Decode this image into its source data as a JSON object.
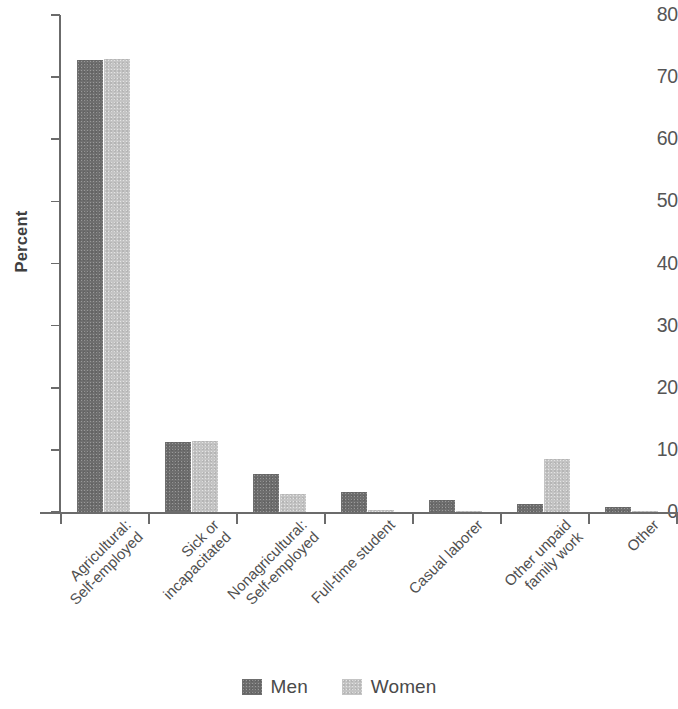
{
  "chart_data": {
    "type": "bar",
    "title": "",
    "xlabel": "",
    "ylabel": "Percent",
    "ylim": [
      0,
      80
    ],
    "yticks": [
      0,
      10,
      20,
      30,
      40,
      50,
      60,
      70,
      80
    ],
    "ytick_labels": [
      "0",
      "10",
      "20",
      "30",
      "40",
      "50",
      "60",
      "70",
      "80"
    ],
    "grid": false,
    "legend_position": "bottom-center",
    "categories": [
      "Agricultural: Self-employed",
      "Sick or incapacitated",
      "Nonagricultural: Self-employed",
      "Full-time student",
      "Casual laborer",
      "Other unpaid family work",
      "Other"
    ],
    "category_lines": [
      [
        "Agricultural:",
        "Self-employed"
      ],
      [
        "Sick or",
        "incapacitated"
      ],
      [
        "Nonagricultural:",
        "Self-employed"
      ],
      [
        "Full-time student"
      ],
      [
        "Casual laborer"
      ],
      [
        "Other unpaid",
        "family work"
      ],
      [
        "Other"
      ]
    ],
    "series": [
      {
        "name": "Men",
        "color": "#6e6e6e",
        "values": [
          72.8,
          11.3,
          6.1,
          3.2,
          1.9,
          1.3,
          0.8
        ]
      },
      {
        "name": "Women",
        "color": "#c4c4c4",
        "values": [
          73.0,
          11.5,
          2.9,
          0.4,
          0.1,
          8.6,
          0.15
        ]
      }
    ]
  },
  "legend": {
    "items": [
      {
        "label": "Men",
        "color": "#6e6e6e"
      },
      {
        "label": "Women",
        "color": "#c4c4c4"
      }
    ]
  },
  "axes": {
    "y_title": "Percent"
  }
}
